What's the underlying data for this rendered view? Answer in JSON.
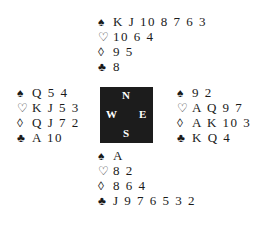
{
  "hands": {
    "north": {
      "spades": "K J 10 8 7 6 3",
      "hearts": "10 6 4",
      "diamonds": "9 5",
      "clubs": "8"
    },
    "west": {
      "spades": "Q 5 4",
      "hearts": "K J 5 3",
      "diamonds": "Q J 7 2",
      "clubs": "A 10"
    },
    "east": {
      "spades": "9 2",
      "hearts": "A Q 9 7",
      "diamonds": "A K 10 3",
      "clubs": "K Q 4"
    },
    "south": {
      "spades": "A",
      "hearts": "8 2",
      "diamonds": "8 6 4",
      "clubs": "J 9 7 6 5 3 2"
    }
  },
  "symbols": {
    "spades": "♠",
    "hearts": "♡",
    "diamonds": "◊",
    "clubs": "♣"
  },
  "compass": {
    "n": "N",
    "e": "E",
    "s": "S",
    "w": "W"
  }
}
